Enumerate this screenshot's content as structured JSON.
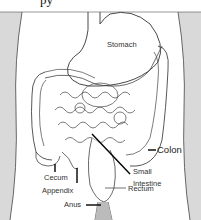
{
  "diagram": {
    "partial_top_text": "py",
    "colors": {
      "side_shade": "#d9d9d9",
      "line": "#333333",
      "leader": "#000000",
      "background": "#ffffff"
    },
    "labels": {
      "stomach": "Stomach",
      "colon": "Colon",
      "small_intestine_1": "Small",
      "small_intestine_2": "Intestine",
      "cecum": "Cecum",
      "appendix": "Appendix",
      "rectum": "Rectum",
      "anus": "Anus"
    }
  }
}
